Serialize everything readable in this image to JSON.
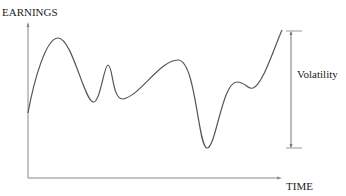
{
  "diagram": {
    "y_axis_label": "EARNINGS",
    "x_axis_label": "TIME",
    "annotation": "Volatility",
    "colors": {
      "line": "#555555",
      "axis": "#888888",
      "text": "#222222"
    }
  }
}
